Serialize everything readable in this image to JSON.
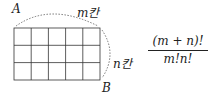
{
  "diagram": {
    "grid": {
      "columns": 5,
      "rows": 3
    },
    "labels": {
      "start": "A",
      "end": "B",
      "horizontal": "m칸",
      "vertical": "n칸"
    },
    "formula": {
      "numerator": "(m + n)!",
      "denominator": "m!n!"
    }
  }
}
